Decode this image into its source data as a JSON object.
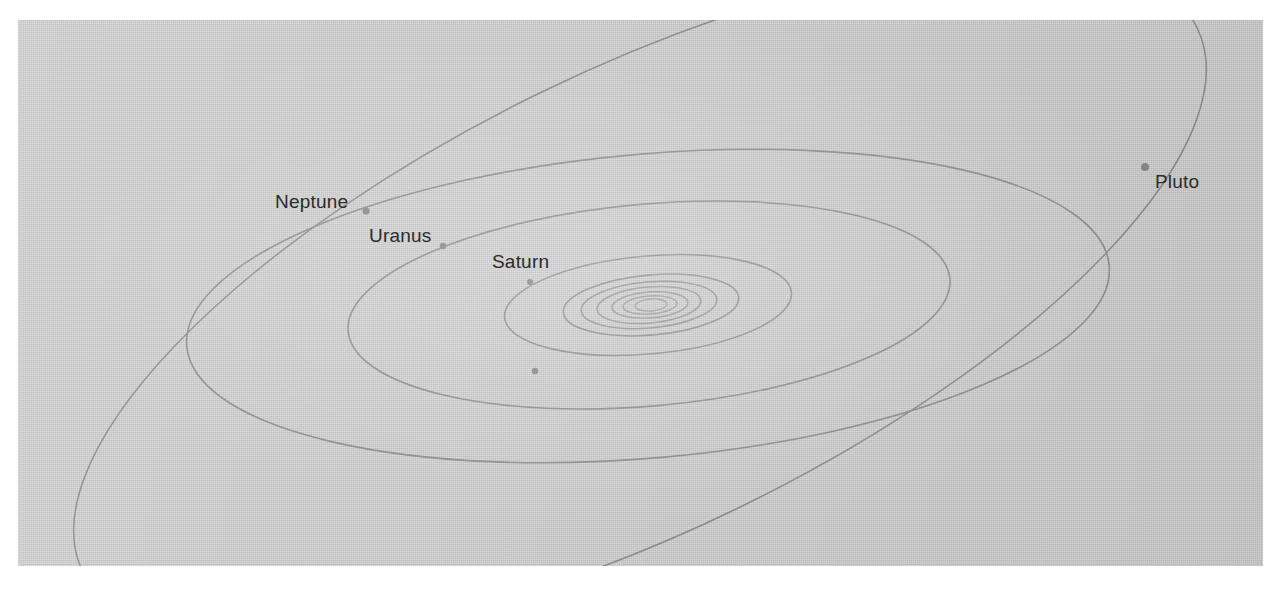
{
  "figure": {
    "kind": "solar-system-orbit-diagram",
    "background_color": "#ffffff",
    "panel_color": "#c9c9c9",
    "orbit_line_color": "#8e8e8e",
    "inner_orbit_line_color": "#9c9c9c",
    "planet_dot_color": "#8a8a8a",
    "label_color": "#2c2c2c",
    "panel": {
      "x": 18,
      "y": 20,
      "width": 1245,
      "height": 546
    }
  },
  "labels": [
    {
      "name": "Neptune",
      "text": "Neptune",
      "x": 275,
      "y": 192
    },
    {
      "name": "Uranus",
      "text": "Uranus",
      "x": 369,
      "y": 226
    },
    {
      "name": "Saturn",
      "text": "Saturn",
      "x": 492,
      "y": 252
    },
    {
      "name": "Pluto",
      "text": "Pluto",
      "x": 1155,
      "y": 172
    }
  ],
  "chart_data": {
    "type": "scatter",
    "title": "",
    "xlabel": "",
    "ylabel": "",
    "center": {
      "x": 651,
      "y": 305
    },
    "orbits": [
      {
        "name": "Mercury",
        "rx": 16,
        "ry": 6,
        "rotation": -4,
        "cx": 651,
        "cy": 305,
        "labeled": false
      },
      {
        "name": "Venus",
        "rx": 27,
        "ry": 9,
        "rotation": -4,
        "cx": 650,
        "cy": 305,
        "labeled": false
      },
      {
        "name": "Earth",
        "rx": 38,
        "ry": 13,
        "rotation": -4,
        "cx": 650,
        "cy": 305,
        "labeled": false
      },
      {
        "name": "Mars",
        "rx": 52,
        "ry": 18,
        "rotation": -5,
        "cx": 649,
        "cy": 305,
        "labeled": false
      },
      {
        "name": "Asteroid Belt",
        "rx": 68,
        "ry": 23,
        "rotation": -5,
        "cx": 649,
        "cy": 305,
        "labeled": false
      },
      {
        "name": "Jupiter",
        "rx": 88,
        "ry": 30,
        "rotation": -5,
        "cx": 651,
        "cy": 305,
        "labeled": false
      },
      {
        "name": "Saturn",
        "rx": 144,
        "ry": 49,
        "rotation": -5,
        "cx": 648,
        "cy": 305,
        "labeled": true
      },
      {
        "name": "Uranus",
        "rx": 302,
        "ry": 101,
        "rotation": -5,
        "cx": 649,
        "cy": 305,
        "labeled": true
      },
      {
        "name": "Neptune",
        "rx": 463,
        "ry": 152,
        "rotation": -5,
        "cx": 648,
        "cy": 306,
        "labeled": true
      },
      {
        "name": "Pluto",
        "rx": 620,
        "ry": 230,
        "rotation": -26,
        "cx": 640,
        "cy": 300,
        "labeled": true
      }
    ],
    "planet_markers": [
      {
        "name": "Neptune",
        "x": 366,
        "y": 211,
        "r": 3.6
      },
      {
        "name": "Uranus",
        "x": 443,
        "y": 246,
        "r": 3.2
      },
      {
        "name": "Saturn",
        "x": 530,
        "y": 282,
        "r": 3.0
      },
      {
        "name": "Pluto",
        "x": 1145,
        "y": 167,
        "r": 4.0
      },
      {
        "name": "unlabeled",
        "x": 535,
        "y": 371,
        "r": 3.2
      }
    ]
  }
}
